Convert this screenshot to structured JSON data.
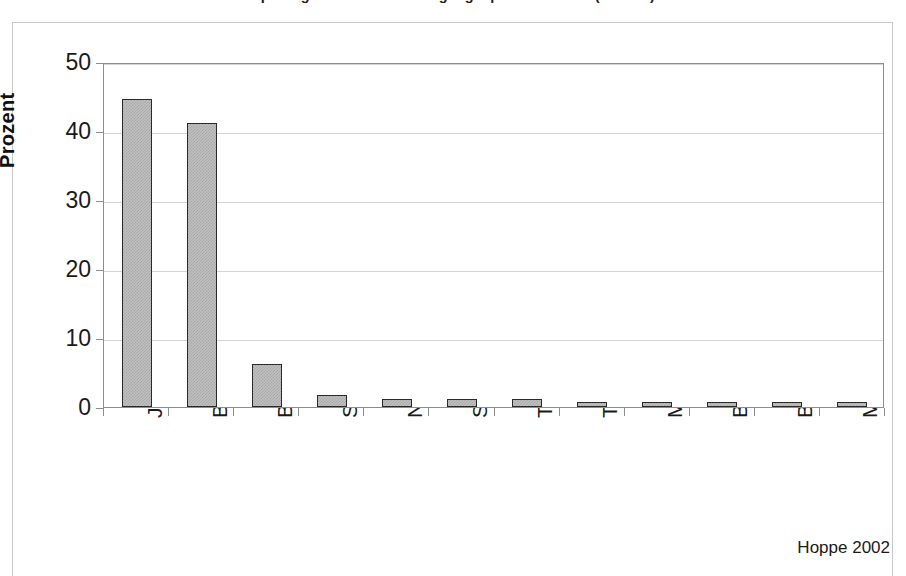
{
  "figure": {
    "title": "Sprachgebrauch in der Umgangssprache in Palu (n = 180)",
    "source_note": "Hoppe 2002"
  },
  "chart_data": {
    "type": "bar",
    "title": "Sprachgebrauch in der Umgangssprache in Palu (n = 180)",
    "xlabel": "",
    "ylabel": "Prozent",
    "ylim": [
      0,
      50
    ],
    "yticks": [
      "0",
      "10",
      "20",
      "30",
      "40",
      "50"
    ],
    "grid": true,
    "legend": false,
    "decimal_separator": ",",
    "categories": [
      "Java",
      "Bali",
      "Bugis",
      "Sunda",
      "Napu",
      "Sasak",
      "Tolaki",
      "Toraja",
      "Makassar",
      "Buol",
      "Banjar",
      "Madura"
    ],
    "values": [
      44.6,
      41.1,
      6.3,
      1.7,
      1.1,
      1.1,
      1.1,
      0.6,
      0.6,
      0.6,
      0.6,
      0.6
    ],
    "value_labels": [
      "44,6",
      "41,1",
      "6,3",
      "1,7",
      "1,1",
      "1,1",
      "1,1",
      "0,6",
      "0,6",
      "0,6",
      "0,6",
      "0,6"
    ],
    "bar_fill": "#c0c0c0",
    "bar_border": "#2a2a2a",
    "gridline_color": "#d5d5d5"
  }
}
